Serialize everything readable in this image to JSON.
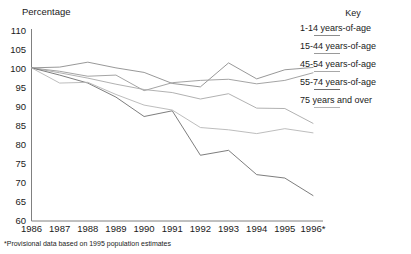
{
  "axis_title": "Percentage",
  "footnote": "*Provisional data based on 1995 population estimates",
  "legend": {
    "title": "Key",
    "entries": [
      {
        "label": "1-14 years-of-age",
        "color": "#8c8c8c"
      },
      {
        "label": "15-44 years-of-age",
        "color": "#9a9a9a"
      },
      {
        "label": "45-54 years-of-age",
        "color": "#a8a8a8"
      },
      {
        "label": "55-74 years-of-age",
        "color": "#6e6e6e"
      },
      {
        "label": "75 years and over",
        "color": "#b5b5b5"
      }
    ]
  },
  "chart_data": {
    "type": "line",
    "title": "",
    "xlabel": "",
    "ylabel": "Percentage",
    "ylim": [
      60,
      110
    ],
    "yticks": [
      110,
      105,
      100,
      95,
      90,
      85,
      80,
      75,
      70,
      65,
      60
    ],
    "grid": false,
    "legend_position": "right",
    "x": [
      "1986",
      "1987",
      "1988",
      "1989",
      "1990",
      "1991",
      "1992",
      "1993",
      "1994",
      "1995",
      "1996*"
    ],
    "categories": [
      "1986",
      "1987",
      "1988",
      "1989",
      "1990",
      "1991",
      "1992",
      "1993",
      "1994",
      "1995",
      "1996*"
    ],
    "series": [
      {
        "name": "1-14 years-of-age",
        "color": "#8c8c8c",
        "values": [
          100.3,
          100.5,
          101.8,
          100.3,
          99.1,
          96.2,
          95.3,
          101.6,
          97.4,
          99.8,
          100.4
        ]
      },
      {
        "name": "15-44 years-of-age",
        "color": "#9a9a9a",
        "values": [
          100.3,
          99.4,
          98.1,
          98.4,
          94.3,
          96.4,
          97.0,
          97.3,
          96.1,
          97.0,
          99.0
        ]
      },
      {
        "name": "45-54 years-of-age",
        "color": "#a8a8a8",
        "values": [
          100.3,
          99.0,
          97.6,
          96.0,
          94.6,
          93.8,
          92.1,
          93.5,
          89.7,
          89.6,
          85.7
        ]
      },
      {
        "name": "55-74 years-of-age",
        "color": "#6e6e6e",
        "values": [
          100.3,
          98.4,
          96.3,
          92.6,
          87.5,
          89.0,
          77.3,
          78.6,
          72.2,
          71.3,
          66.7
        ]
      },
      {
        "name": "75 years and over",
        "color": "#b5b5b5",
        "values": [
          100.3,
          96.3,
          96.5,
          93.3,
          90.5,
          89.2,
          84.6,
          84.0,
          83.0,
          84.3,
          83.2
        ]
      }
    ]
  }
}
